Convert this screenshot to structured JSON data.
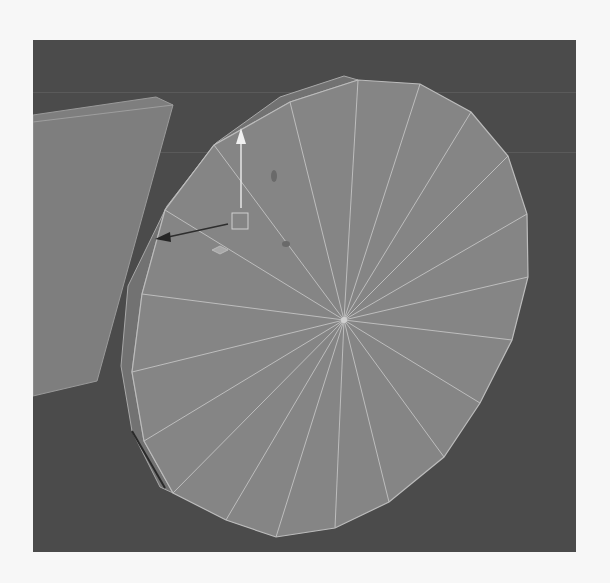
{
  "viewport": {
    "name": "3D modeling perspective viewport",
    "background_color": "#4b4b4b",
    "objects": [
      {
        "name": "side-panel-plane",
        "fill": "#7e7e7e",
        "edge": "#9a9a9a"
      },
      {
        "name": "disc-cylinder",
        "segments": 20,
        "fill": "#858585",
        "wire": "#b9b9b9"
      }
    ],
    "manipulator": {
      "type": "move-tool",
      "axes": [
        {
          "axis": "y",
          "color": "#e8e8e8"
        },
        {
          "axis": "x",
          "color": "#2e2e2e"
        },
        {
          "axis": "z",
          "color": "#9a9a9a"
        }
      ],
      "center_handle_color": "#cfcfcf"
    }
  }
}
